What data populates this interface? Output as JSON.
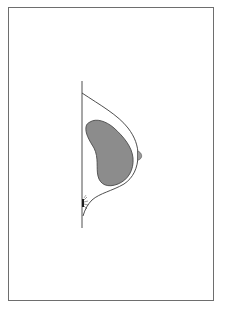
{
  "figure": {
    "type": "anatomical-line-diagram",
    "labels": [],
    "colors": {
      "background": "#ffffff",
      "frame": "#6e6e6e",
      "outline": "#3a3a3a",
      "implant_fill": "#8c8c8c",
      "implant_stroke": "#4a4a4a"
    },
    "elements": [
      {
        "name": "chest-wall-line",
        "description": "vertical line"
      },
      {
        "name": "breast-outline",
        "description": "curved skin contour"
      },
      {
        "name": "nipple",
        "description": "small gray bump at apex"
      },
      {
        "name": "implant",
        "description": "gray kidney-shaped implant"
      },
      {
        "name": "incision-mark",
        "description": "small dark mark with radiating strokes at inframammary fold"
      }
    ]
  }
}
